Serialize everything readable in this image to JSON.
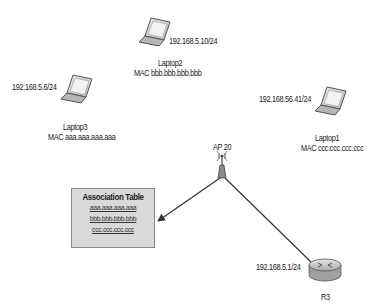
{
  "diagram": {
    "devices": {
      "laptop1": {
        "name": "Laptop1",
        "ip": "192.168.56.41/24",
        "mac": "MAC ccc.ccc.ccc.ccc"
      },
      "laptop2": {
        "name": "Laptop2",
        "ip": "192.168.5.10/24",
        "mac": "MAC bbb.bbb.bbb.bbb"
      },
      "laptop3": {
        "name": "Laptop3",
        "ip": "192.168.5.6/24",
        "mac": "MAC aaa.aaa.aaa.aaa"
      },
      "access_point": {
        "name": "AP 20"
      },
      "router": {
        "name": "R3",
        "ip": "192.168.5.1/24"
      }
    },
    "association_table": {
      "title": "Association Table",
      "entries": [
        "aaa.aaa.aaa.aaa",
        "bbb.bbb.bbb.bbb",
        "ccc.ccc.ccc.ccc"
      ]
    },
    "colors": {
      "line": "#333333",
      "table_fill": "#d9d9d9",
      "table_border": "#8a8a8a",
      "device_gray": "#9a9a9a"
    }
  }
}
